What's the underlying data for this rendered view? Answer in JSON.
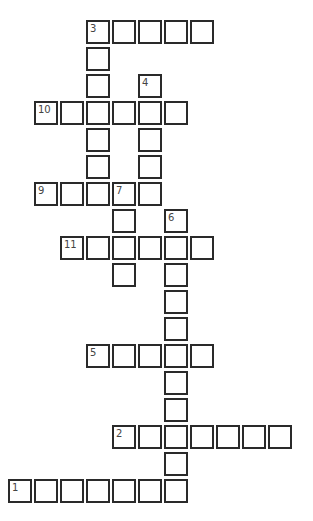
{
  "puzzle": {
    "grid": {
      "origin_x": 8,
      "origin_y": 20,
      "col_pitch": 26,
      "row_pitch": 27
    },
    "words": [
      {
        "number": "3",
        "direction": "across",
        "row": 0,
        "col": 3,
        "length": 5
      },
      {
        "number": "3",
        "direction": "down",
        "row": 0,
        "col": 3,
        "length": 7
      },
      {
        "number": "4",
        "direction": "down",
        "row": 2,
        "col": 5,
        "length": 5
      },
      {
        "number": "10",
        "direction": "across",
        "row": 3,
        "col": 1,
        "length": 6
      },
      {
        "number": "9",
        "direction": "across",
        "row": 6,
        "col": 1,
        "length": 4
      },
      {
        "number": "7",
        "direction": "down",
        "row": 6,
        "col": 4,
        "length": 4
      },
      {
        "number": "6",
        "direction": "down",
        "row": 7,
        "col": 6,
        "length": 11
      },
      {
        "number": "11",
        "direction": "across",
        "row": 8,
        "col": 2,
        "length": 6
      },
      {
        "number": "5",
        "direction": "across",
        "row": 12,
        "col": 3,
        "length": 5
      },
      {
        "number": "2",
        "direction": "across",
        "row": 15,
        "col": 4,
        "length": 7
      },
      {
        "number": "1",
        "direction": "across",
        "row": 17,
        "col": 0,
        "length": 7
      }
    ]
  }
}
